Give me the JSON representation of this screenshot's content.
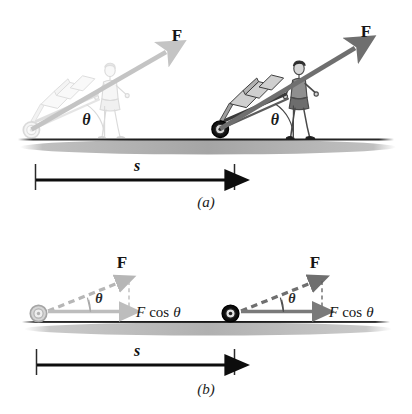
{
  "figure": {
    "background_color": "#ffffff",
    "panels": [
      {
        "id": "a",
        "caption": "(a)",
        "description": "Two snapshots of a person pulling a hand truck with force F at angle theta to the horizontal, separated by displacement s",
        "scenes": [
          {
            "id": "left",
            "state": "initial-faded",
            "tint": "#c9c9c9",
            "force_label": "F",
            "angle_label": "θ"
          },
          {
            "id": "right",
            "state": "final-solid",
            "tint": "#6e6e6e",
            "force_label": "F",
            "angle_label": "θ"
          }
        ],
        "displacement": {
          "label": "s",
          "arrow_color": "#0d0d0d"
        },
        "ground": {
          "line_color": "#1c1c1c",
          "shadow_color": "#9a9a9a"
        }
      },
      {
        "id": "b",
        "caption": "(b)",
        "description": "Vector decomposition: dashed F vector at angle theta with horizontal component F cos theta",
        "scenes": [
          {
            "id": "left",
            "state": "initial-faded",
            "tint": "#b3b3b3",
            "force_label": "F",
            "angle_label": "θ",
            "component_label_italic": "F",
            "component_label_upright": "cos",
            "component_label_symbol": "θ",
            "component_label_full": "F cos θ"
          },
          {
            "id": "right",
            "state": "final-solid",
            "tint": "#707070",
            "force_label": "F",
            "angle_label": "θ",
            "component_label_italic": "F",
            "component_label_upright": "cos",
            "component_label_symbol": "θ",
            "component_label_full": "F cos θ"
          }
        ],
        "displacement": {
          "label": "s",
          "arrow_color": "#0d0d0d"
        },
        "ground": {
          "line_color": "#1c1c1c",
          "shadow_color": "#9a9a9a"
        }
      }
    ],
    "colors": {
      "force_arrow_dark": "#6f6f6f",
      "force_arrow_light": "#c4c4c4",
      "component_arrow_dark": "#7a7a7a",
      "component_arrow_light": "#bdbdbd",
      "ink": "#111111",
      "paper": "#ffffff"
    }
  }
}
